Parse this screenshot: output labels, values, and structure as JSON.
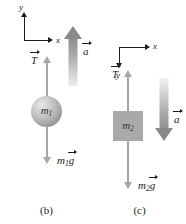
{
  "figure": {
    "background_color": "#ffffff",
    "width": 186,
    "height": 224
  },
  "colors": {
    "axis": "#1c1c1c",
    "force_arrow": "#a6a6a6",
    "accel_arrow": "#8a8a8a",
    "block_fill": "#a9a9a9",
    "sphere_fill": "#aeaeae",
    "text": "#1c1c1c"
  },
  "panels": [
    {
      "id": "b",
      "caption": "(b)",
      "body": {
        "shape": "sphere",
        "mass_symbol": "m",
        "mass_subscript": "1"
      },
      "axes": {
        "x_label": "x",
        "y_label": "y",
        "x_direction": "right",
        "y_direction": "up"
      },
      "forces": [
        {
          "name": "tension",
          "symbol": "T",
          "vector": true,
          "direction": "up"
        },
        {
          "name": "weight",
          "symbol": "m",
          "subscript": "1",
          "symbol_tail": "g",
          "vector": true,
          "direction": "down"
        }
      ],
      "acceleration": {
        "symbol": "a",
        "vector": true,
        "direction": "up"
      }
    },
    {
      "id": "c",
      "caption": "(c)",
      "body": {
        "shape": "square",
        "mass_symbol": "m",
        "mass_subscript": "2"
      },
      "axes": {
        "x_label": "x",
        "y_label": "y",
        "x_direction": "right",
        "y_direction": "down"
      },
      "forces": [
        {
          "name": "tension",
          "symbol": "T",
          "vector": true,
          "direction": "up"
        },
        {
          "name": "weight",
          "symbol": "m",
          "subscript": "2",
          "symbol_tail": "g",
          "vector": true,
          "direction": "down"
        }
      ],
      "acceleration": {
        "symbol": "a",
        "vector": true,
        "direction": "down"
      }
    }
  ]
}
